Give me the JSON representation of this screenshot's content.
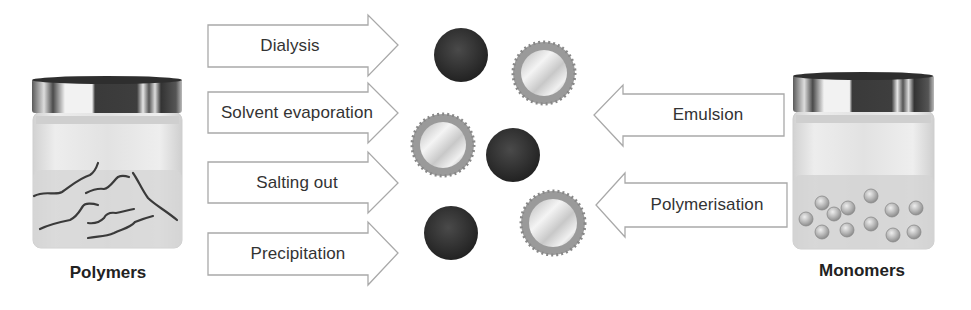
{
  "diagram": {
    "left_source": {
      "label": "Polymers",
      "icon": "jar-with-polymer-chains"
    },
    "right_source": {
      "label": "Monomers",
      "icon": "jar-with-monomer-spheres"
    },
    "polymer_methods": [
      {
        "label": "Dialysis",
        "direction": "right"
      },
      {
        "label": "Solvent evaporation",
        "direction": "right"
      },
      {
        "label": "Salting out",
        "direction": "right"
      },
      {
        "label": "Precipitation",
        "direction": "right"
      }
    ],
    "monomer_methods": [
      {
        "label": "Emulsion",
        "direction": "left"
      },
      {
        "label": "Polymerisation",
        "direction": "left"
      }
    ],
    "products": {
      "nanospheres": 3,
      "nanocapsules": 3,
      "nanosphere_icon": "dark-solid-sphere",
      "nanocapsule_icon": "coated-shell-sphere"
    },
    "colors": {
      "arrow_stroke": "#a9a9a9",
      "nanosphere": "#2e2e2e",
      "nanocapsule_shell": "#8f8f8f",
      "jar_lid": "#3a3a3a",
      "jar_body": "#dcdcdc",
      "text": "#333333"
    }
  }
}
